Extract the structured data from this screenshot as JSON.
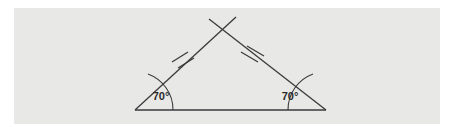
{
  "figure": {
    "type": "geometry-diagram",
    "background_color": "#ffffff",
    "panel_color": "#e8e8e6",
    "stroke_color": "#3a3a3c",
    "text_color": "#2a2a2c",
    "shape": "triangle",
    "shape_kind": "isosceles",
    "labels": {
      "left_angle": "70°",
      "right_angle": "70°"
    },
    "vertices": {
      "base_left": {
        "x": 135,
        "y": 110
      },
      "base_right": {
        "x": 326,
        "y": 110
      },
      "apex": {
        "x": 222,
        "y": 30
      }
    },
    "congruence_marks": {
      "left_side_ticks": 2,
      "right_side_ticks": 2
    },
    "angle_arcs": {
      "left_radius": 38,
      "right_radius": 38
    },
    "apex_overshoot": true
  }
}
